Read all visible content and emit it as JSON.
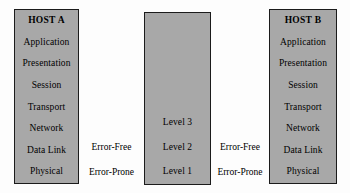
{
  "diagram": {
    "colors": {
      "box_fill": "#a8a8a8",
      "box_border": "#1b1b1b",
      "text": "#000000",
      "canvas_background": "#fdfdfd"
    },
    "host_a": {
      "title": "HOST A",
      "layers": [
        "Application",
        "Presentation",
        "Session",
        "Transport",
        "Network",
        "Data Link",
        "Physical"
      ]
    },
    "middle": {
      "title": "",
      "layers": [
        "",
        "",
        "",
        "",
        "Level 3",
        "Level 2",
        "Level 1"
      ]
    },
    "host_b": {
      "title": "HOST B",
      "layers": [
        "Application",
        "Presentation",
        "Session",
        "Transport",
        "Network",
        "Data Link",
        "Physical"
      ]
    },
    "gap_left": {
      "rows": [
        "",
        "",
        "",
        "",
        "",
        "Error-Free",
        "Error-Prone"
      ]
    },
    "gap_right": {
      "rows": [
        "",
        "",
        "",
        "",
        "",
        "Error-Free",
        "Error-Prone"
      ]
    }
  }
}
